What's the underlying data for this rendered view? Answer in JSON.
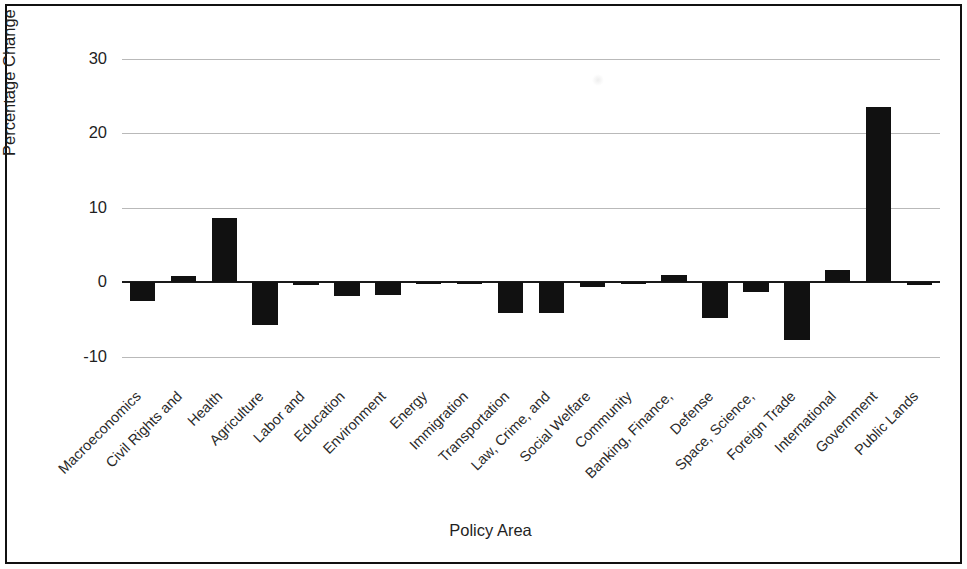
{
  "chart_data": {
    "type": "bar",
    "title": "",
    "xlabel": "Policy Area",
    "ylabel": "Percentage Change",
    "ylim": [
      -13,
      32
    ],
    "yticks": [
      30,
      20,
      10,
      0,
      -10
    ],
    "ytick_labels": [
      "30",
      "20",
      "10",
      "0",
      "-10"
    ],
    "grid": true,
    "legend": null,
    "bar_color": "#111111",
    "categories": [
      "Macroeconomics",
      "Civil Rights and",
      "Health",
      "Agriculture",
      "Labor and",
      "Education",
      "Environment",
      "Energy",
      "Immigration",
      "Transportation",
      "Law, Crime, and",
      "Social Welfare",
      "Community",
      "Banking, Finance,",
      "Defense",
      "Space, Science,",
      "Foreign Trade",
      "International",
      "Government",
      "Public Lands"
    ],
    "values": [
      -2.5,
      0.8,
      8.6,
      -5.8,
      -0.4,
      -1.9,
      -1.7,
      -0.3,
      -0.3,
      -4.2,
      -4.2,
      -0.7,
      -0.1,
      1.0,
      -4.8,
      -1.3,
      -7.8,
      1.6,
      23.5,
      -0.4
    ]
  },
  "axis": {
    "y_title": "Percentage Change",
    "x_title": "Policy Area"
  }
}
